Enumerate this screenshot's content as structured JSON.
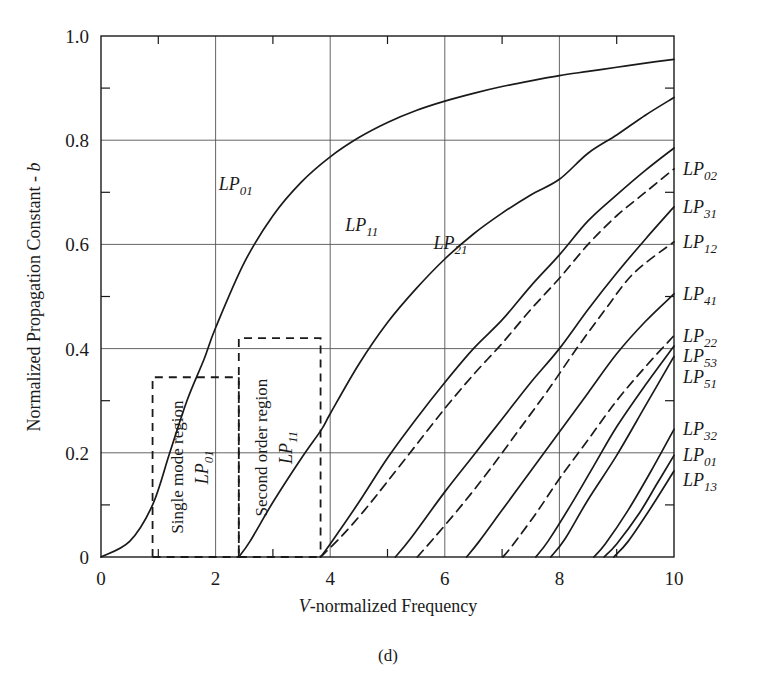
{
  "caption": "(d)",
  "chart_data": {
    "type": "line",
    "title": "",
    "xlabel": "V-normalized Frequency",
    "ylabel": "Normalized Propagation Constant - b",
    "xlim": [
      0,
      10
    ],
    "ylim": [
      0,
      1.0
    ],
    "xticks": [
      0,
      2,
      4,
      6,
      8,
      10
    ],
    "xticklabels": [
      "0",
      "2",
      "4",
      "6",
      "8",
      "10"
    ],
    "xminorticks": [
      1,
      3,
      5,
      7,
      9
    ],
    "yticks": [
      0,
      0.2,
      0.4,
      0.6,
      0.8,
      1.0
    ],
    "yticklabels": [
      "0",
      "0.2",
      "0.4",
      "0.6",
      "0.8",
      "1.0"
    ],
    "yminorticks": [
      0.1,
      0.3,
      0.5,
      0.7,
      0.9
    ],
    "grid": true,
    "legend": "inline-labels",
    "series": [
      {
        "name": "LP01",
        "style": "solid",
        "cutoff": 0.0,
        "b_at_10": 0.955,
        "points": [
          [
            0.0,
            0.0
          ],
          [
            0.5,
            0.03
          ],
          [
            0.9,
            0.1
          ],
          [
            1.2,
            0.2
          ],
          [
            1.5,
            0.3
          ],
          [
            1.8,
            0.38
          ],
          [
            2.0,
            0.44
          ],
          [
            2.5,
            0.565
          ],
          [
            3.0,
            0.655
          ],
          [
            3.5,
            0.72
          ],
          [
            4.0,
            0.768
          ],
          [
            4.5,
            0.805
          ],
          [
            5.0,
            0.834
          ],
          [
            5.5,
            0.857
          ],
          [
            6.0,
            0.875
          ],
          [
            6.5,
            0.89
          ],
          [
            7.0,
            0.903
          ],
          [
            7.5,
            0.914
          ],
          [
            8.0,
            0.924
          ],
          [
            8.5,
            0.932
          ],
          [
            9.0,
            0.94
          ],
          [
            9.5,
            0.948
          ],
          [
            10.0,
            0.955
          ]
        ]
      },
      {
        "name": "LP11",
        "style": "solid",
        "cutoff": 2.405,
        "b_at_10": 0.882,
        "points": [
          [
            2.405,
            0.0
          ],
          [
            2.6,
            0.03
          ],
          [
            3.0,
            0.105
          ],
          [
            3.5,
            0.19
          ],
          [
            3.85,
            0.245
          ],
          [
            4.0,
            0.275
          ],
          [
            4.5,
            0.37
          ],
          [
            5.0,
            0.45
          ],
          [
            5.5,
            0.515
          ],
          [
            6.0,
            0.572
          ],
          [
            6.5,
            0.62
          ],
          [
            7.0,
            0.66
          ],
          [
            7.5,
            0.695
          ],
          [
            8.0,
            0.725
          ],
          [
            8.5,
            0.775
          ],
          [
            9.0,
            0.81
          ],
          [
            9.5,
            0.848
          ],
          [
            10.0,
            0.882
          ]
        ]
      },
      {
        "name": "LP21",
        "style": "solid",
        "cutoff": 3.832,
        "b_at_10": 0.785,
        "points": [
          [
            3.832,
            0.0
          ],
          [
            4.0,
            0.025
          ],
          [
            4.5,
            0.105
          ],
          [
            5.0,
            0.19
          ],
          [
            5.5,
            0.265
          ],
          [
            6.0,
            0.335
          ],
          [
            6.5,
            0.4
          ],
          [
            7.0,
            0.455
          ],
          [
            7.5,
            0.52
          ],
          [
            8.0,
            0.58
          ],
          [
            8.5,
            0.645
          ],
          [
            9.0,
            0.695
          ],
          [
            9.5,
            0.742
          ],
          [
            10.0,
            0.785
          ]
        ]
      },
      {
        "name": "LP02",
        "style": "dashed",
        "cutoff": 3.832,
        "b_at_10": 0.745,
        "points": [
          [
            3.832,
            0.0
          ],
          [
            4.2,
            0.04
          ],
          [
            4.6,
            0.09
          ],
          [
            5.0,
            0.145
          ],
          [
            5.5,
            0.215
          ],
          [
            6.0,
            0.285
          ],
          [
            6.5,
            0.35
          ],
          [
            7.0,
            0.41
          ],
          [
            7.5,
            0.475
          ],
          [
            8.0,
            0.535
          ],
          [
            8.5,
            0.6
          ],
          [
            9.0,
            0.655
          ],
          [
            9.5,
            0.7
          ],
          [
            10.0,
            0.745
          ]
        ]
      },
      {
        "name": "LP31",
        "style": "solid",
        "cutoff": 5.136,
        "b_at_10": 0.672,
        "points": [
          [
            5.136,
            0.0
          ],
          [
            5.4,
            0.035
          ],
          [
            6.0,
            0.125
          ],
          [
            6.5,
            0.195
          ],
          [
            7.0,
            0.265
          ],
          [
            7.5,
            0.335
          ],
          [
            8.0,
            0.4
          ],
          [
            8.5,
            0.475
          ],
          [
            9.0,
            0.545
          ],
          [
            9.5,
            0.61
          ],
          [
            10.0,
            0.672
          ]
        ]
      },
      {
        "name": "LP12",
        "style": "dashed",
        "cutoff": 5.52,
        "b_at_10": 0.605,
        "points": [
          [
            5.52,
            0.0
          ],
          [
            5.8,
            0.035
          ],
          [
            6.3,
            0.1
          ],
          [
            6.8,
            0.17
          ],
          [
            7.3,
            0.245
          ],
          [
            7.8,
            0.32
          ],
          [
            8.3,
            0.4
          ],
          [
            8.8,
            0.475
          ],
          [
            9.3,
            0.545
          ],
          [
            10.0,
            0.605
          ]
        ]
      },
      {
        "name": "LP41",
        "style": "solid",
        "cutoff": 6.38,
        "b_at_10": 0.505,
        "points": [
          [
            6.38,
            0.0
          ],
          [
            6.6,
            0.03
          ],
          [
            7.0,
            0.09
          ],
          [
            7.5,
            0.165
          ],
          [
            8.0,
            0.24
          ],
          [
            8.5,
            0.315
          ],
          [
            9.0,
            0.39
          ],
          [
            9.5,
            0.452
          ],
          [
            10.0,
            0.505
          ]
        ]
      },
      {
        "name": "LP22",
        "style": "dashed",
        "cutoff": 7.016,
        "b_at_10": 0.425,
        "points": [
          [
            7.016,
            0.0
          ],
          [
            7.2,
            0.025
          ],
          [
            7.6,
            0.085
          ],
          [
            8.0,
            0.15
          ],
          [
            8.5,
            0.225
          ],
          [
            9.0,
            0.3
          ],
          [
            9.5,
            0.365
          ],
          [
            10.0,
            0.425
          ]
        ]
      },
      {
        "name": "LP53",
        "style": "solid",
        "cutoff": 7.588,
        "b_at_10": 0.405,
        "points": [
          [
            7.588,
            0.0
          ],
          [
            7.8,
            0.03
          ],
          [
            8.2,
            0.1
          ],
          [
            8.6,
            0.175
          ],
          [
            9.0,
            0.25
          ],
          [
            9.5,
            0.33
          ],
          [
            10.0,
            0.405
          ]
        ]
      },
      {
        "name": "LP51",
        "style": "solid",
        "cutoff": 7.85,
        "b_at_10": 0.385,
        "points": [
          [
            7.85,
            0.0
          ],
          [
            8.1,
            0.035
          ],
          [
            8.5,
            0.11
          ],
          [
            9.0,
            0.195
          ],
          [
            9.5,
            0.29
          ],
          [
            10.0,
            0.385
          ]
        ]
      },
      {
        "name": "LP32",
        "style": "solid",
        "cutoff": 8.6,
        "b_at_10": 0.245,
        "points": [
          [
            8.6,
            0.0
          ],
          [
            8.8,
            0.025
          ],
          [
            9.2,
            0.09
          ],
          [
            9.6,
            0.165
          ],
          [
            10.0,
            0.245
          ]
        ]
      },
      {
        "name": "LP01b",
        "style": "solid",
        "cutoff": 8.78,
        "b_at_10": 0.195,
        "points": [
          [
            8.78,
            0.0
          ],
          [
            9.0,
            0.025
          ],
          [
            9.4,
            0.085
          ],
          [
            9.7,
            0.14
          ],
          [
            10.0,
            0.195
          ]
        ]
      },
      {
        "name": "LP13",
        "style": "solid",
        "cutoff": 8.95,
        "b_at_10": 0.165,
        "points": [
          [
            8.95,
            0.0
          ],
          [
            9.2,
            0.03
          ],
          [
            9.6,
            0.095
          ],
          [
            10.0,
            0.165
          ]
        ]
      }
    ],
    "edge_labels": [
      {
        "text": "LP",
        "sub": "02",
        "b": 0.745
      },
      {
        "text": "LP",
        "sub": "31",
        "b": 0.672
      },
      {
        "text": "LP",
        "sub": "12",
        "b": 0.605
      },
      {
        "text": "LP",
        "sub": "41",
        "b": 0.505
      },
      {
        "text": "LP",
        "sub": "22",
        "b": 0.425
      },
      {
        "text": "LP",
        "sub": "53",
        "b": 0.385
      },
      {
        "text": "LP",
        "sub": "51",
        "b": 0.345
      },
      {
        "text": "LP",
        "sub": "32",
        "b": 0.245
      },
      {
        "text": "LP",
        "sub": "01",
        "b": 0.195
      },
      {
        "text": "LP",
        "sub": "13",
        "b": 0.148
      }
    ],
    "inline_labels": [
      {
        "text": "LP",
        "sub": "01",
        "v": 2.35,
        "b": 0.705
      },
      {
        "text": "LP",
        "sub": "11",
        "v": 4.55,
        "b": 0.625
      },
      {
        "text": "LP",
        "sub": "21",
        "v": 6.1,
        "b": 0.592
      }
    ],
    "annotations": [
      {
        "name": "single-mode-region",
        "label": "Single mode region",
        "mode_text": "LP",
        "mode_sub": "01",
        "box": {
          "v_start": 0.9,
          "v_end": 2.405,
          "b_top": 0.345
        }
      },
      {
        "name": "second-order-region",
        "label": "Second order region",
        "mode_text": "LP",
        "mode_sub": "11",
        "box": {
          "v_start": 2.405,
          "v_end": 3.832,
          "b_top": 0.42
        }
      }
    ],
    "colors": {
      "line": "#1a1a1a",
      "grid": "#555555",
      "axis": "#1a1a1a",
      "background": "#ffffff"
    }
  }
}
